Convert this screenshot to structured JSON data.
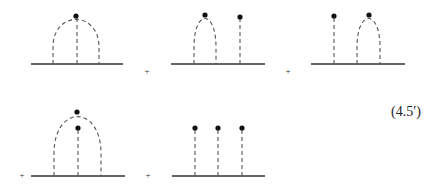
{
  "equation_label": "(4.5′)",
  "operator_symbol": "+",
  "colors": {
    "line": "#333333",
    "dashed": "#555555",
    "vertex": "#111111",
    "background": "#ffffff"
  },
  "diagrams": [
    {
      "id": "d1",
      "description": "single arch with central stick ending at arch apex vertex",
      "baseline": {
        "x1": 31,
        "x2": 123,
        "y": 64
      },
      "arches": [
        {
          "x1": 53,
          "x2": 99,
          "apex_y": 16
        }
      ],
      "sticks": [
        {
          "x": 77,
          "top_y": 16
        }
      ],
      "vertices": [
        {
          "x": 76,
          "y": 16
        }
      ]
    },
    {
      "id": "d2",
      "description": "arch with apex vertex, plus separate stick with vertex on right",
      "baseline": {
        "x1": 171,
        "x2": 265,
        "y": 64
      },
      "arches": [
        {
          "x1": 194,
          "x2": 216,
          "apex_y": 15
        }
      ],
      "sticks": [
        {
          "x": 240,
          "top_y": 17
        }
      ],
      "vertices": [
        {
          "x": 205,
          "y": 15
        },
        {
          "x": 240,
          "y": 17
        }
      ]
    },
    {
      "id": "d3",
      "description": "stick with vertex on left, arch with apex vertex on right",
      "baseline": {
        "x1": 311,
        "x2": 405,
        "y": 64
      },
      "arches": [
        {
          "x1": 357,
          "x2": 380,
          "apex_y": 15
        }
      ],
      "sticks": [
        {
          "x": 334,
          "top_y": 16
        }
      ],
      "vertices": [
        {
          "x": 334,
          "y": 16
        },
        {
          "x": 369,
          "y": 15
        }
      ]
    },
    {
      "id": "d4",
      "description": "arch with apex vertex enclosing a shorter central stick with vertex",
      "baseline": {
        "x1": 31,
        "x2": 125,
        "y": 176
      },
      "arches": [
        {
          "x1": 54,
          "x2": 101,
          "apex_y": 112
        }
      ],
      "sticks": [
        {
          "x": 78,
          "top_y": 128
        }
      ],
      "vertices": [
        {
          "x": 77,
          "y": 112
        },
        {
          "x": 78,
          "y": 128
        }
      ]
    },
    {
      "id": "d5",
      "description": "three separate sticks each ending in a vertex",
      "baseline": {
        "x1": 172,
        "x2": 265,
        "y": 176
      },
      "arches": [],
      "sticks": [
        {
          "x": 195,
          "top_y": 128
        },
        {
          "x": 218,
          "top_y": 128
        },
        {
          "x": 242,
          "top_y": 128
        }
      ],
      "vertices": [
        {
          "x": 195,
          "y": 128
        },
        {
          "x": 218,
          "y": 128
        },
        {
          "x": 242,
          "y": 128
        }
      ]
    }
  ],
  "plus_signs": [
    {
      "x": 147,
      "y": 71
    },
    {
      "x": 288,
      "y": 71
    },
    {
      "x": 22,
      "y": 175
    },
    {
      "x": 148,
      "y": 175
    }
  ]
}
